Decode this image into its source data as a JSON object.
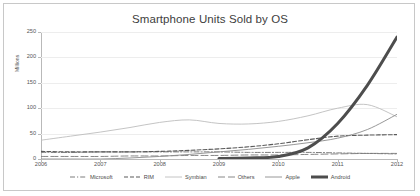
{
  "window": {
    "width": 420,
    "height": 196,
    "background": "#ffffff",
    "border_color": "#c8c8c8"
  },
  "header": {
    "title": "Smartphone Units Sold by OS"
  },
  "axes": {
    "y_axis_label": "Millions",
    "y_ticks": [
      "250",
      "200",
      "150",
      "100",
      "50",
      "0"
    ],
    "x_ticks": [
      "2006",
      "2007",
      "2008",
      "2009",
      "2010",
      "2011",
      "2012"
    ]
  },
  "legend": {
    "position": "bottom-center",
    "items": [
      {
        "label": "Microsoft",
        "style": "dash-dot",
        "color": "#6e6e6e",
        "width": 0.9
      },
      {
        "label": "RIM",
        "style": "dashed",
        "color": "#5a5a5a",
        "width": 1.1
      },
      {
        "label": "Symbian",
        "style": "solid",
        "color": "#bdbdbd",
        "width": 0.9
      },
      {
        "label": "Others",
        "style": "long-dash",
        "color": "#7a7a7a",
        "width": 0.9
      },
      {
        "label": "Apple",
        "style": "solid",
        "color": "#8c8c8c",
        "width": 0.9
      },
      {
        "label": "Android",
        "style": "solid",
        "color": "#4d4d4d",
        "width": 3.0
      }
    ]
  },
  "chart_data": {
    "type": "line",
    "title": "Smartphone Units Sold by OS",
    "xlabel": "",
    "ylabel": "Millions",
    "xlim": [
      2006,
      2012
    ],
    "ylim": [
      0,
      250
    ],
    "y_ticks": [
      0,
      50,
      100,
      150,
      200,
      250
    ],
    "x_ticks": [
      2006,
      2007,
      2008,
      2009,
      2010,
      2011,
      2012
    ],
    "grid": true,
    "legend_position": "bottom-center",
    "x": [
      2006,
      2006.5,
      2007,
      2007.5,
      2008,
      2008.5,
      2009,
      2009.5,
      2010,
      2010.5,
      2011,
      2011.5,
      2012
    ],
    "series": [
      {
        "name": "Microsoft",
        "style": "dash-dot",
        "color": "#6e6e6e",
        "values": [
          13,
          13,
          14,
          14,
          14,
          14,
          14,
          13,
          13,
          13,
          12,
          11,
          10
        ]
      },
      {
        "name": "RIM",
        "style": "dashed",
        "color": "#5a5a5a",
        "values": [
          15,
          14,
          14,
          14,
          15,
          17,
          20,
          24,
          30,
          38,
          45,
          47,
          48
        ]
      },
      {
        "name": "Symbian",
        "style": "solid",
        "color": "#bdbdbd",
        "values": [
          37,
          45,
          53,
          62,
          72,
          77,
          70,
          69,
          74,
          85,
          100,
          107,
          83
        ]
      },
      {
        "name": "Others",
        "style": "long-dash",
        "color": "#7a7a7a",
        "values": [
          5,
          5,
          5,
          6,
          6,
          7,
          7,
          8,
          8,
          9,
          10,
          11,
          11
        ]
      },
      {
        "name": "Apple",
        "style": "solid",
        "color": "#8c8c8c",
        "values": [
          0,
          0,
          0,
          2,
          5,
          9,
          14,
          19,
          25,
          32,
          41,
          58,
          88
        ]
      },
      {
        "name": "Android",
        "style": "solid",
        "color": "#4d4d4d",
        "values": [
          null,
          null,
          null,
          null,
          null,
          null,
          1,
          2,
          5,
          22,
          70,
          145,
          240
        ]
      }
    ]
  }
}
